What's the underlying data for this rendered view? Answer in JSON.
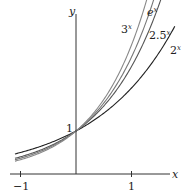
{
  "chart_data": {
    "type": "line",
    "title": "",
    "xlabel": "x",
    "ylabel": "y",
    "xlim": [
      -1.1,
      1.8
    ],
    "ylim": [
      0,
      4.0
    ],
    "xticks": [
      -1,
      1
    ],
    "xtick_labels": [
      "−1",
      "1"
    ],
    "annotations": [
      {
        "text": "1",
        "x": 0,
        "y": 1
      }
    ],
    "grid": false,
    "legend": "inline labels at curve ends",
    "series": [
      {
        "name": "2^x",
        "label": "2x",
        "base": 2,
        "color": "#222222"
      },
      {
        "name": "2.5^x",
        "label": "2.5x",
        "base": 2.5,
        "color": "#555555"
      },
      {
        "name": "e^x",
        "label": "ex",
        "base": 2.718281828,
        "color": "#777777"
      },
      {
        "name": "3^x",
        "label": "3x",
        "base": 3,
        "color": "#888888"
      }
    ]
  },
  "labels": {
    "x_axis": "x",
    "y_axis": "y",
    "tick_neg1": "−1",
    "tick_1": "1",
    "y_intercept": "1",
    "l3": "3",
    "le": "e",
    "l25": "2.5",
    "l2": "2",
    "sup": "x"
  }
}
